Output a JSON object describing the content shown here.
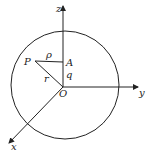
{
  "diagram": {
    "type": "coordinate-sphere",
    "labels": {
      "z_axis": "z",
      "y_axis": "y",
      "x_axis": "x",
      "origin": "O",
      "point_p": "P",
      "point_a": "A",
      "rho": "ρ",
      "r": "r",
      "q": "q"
    },
    "colors": {
      "stroke": "#222222",
      "background": "#ffffff"
    }
  }
}
